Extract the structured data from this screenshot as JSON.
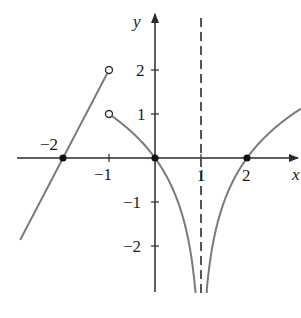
{
  "chart_data": {
    "type": "line",
    "title": "",
    "xlabel": "x",
    "ylabel": "y",
    "xlim": [
      -3.0,
      3.15
    ],
    "ylim": [
      -3.1,
      3.2
    ],
    "grid": false,
    "x_ticks": [
      {
        "value": -1,
        "label": "−1"
      },
      {
        "value": 1,
        "label": "1"
      },
      {
        "value": 2,
        "label": "2"
      }
    ],
    "y_ticks": [
      {
        "value": 2,
        "label": "2"
      },
      {
        "value": 1,
        "label": "1"
      },
      {
        "value": -1,
        "label": "−1"
      },
      {
        "value": -2,
        "label": "−2"
      }
    ],
    "annotations": [
      {
        "text": "−2",
        "at": [
          -2,
          0
        ],
        "note": "x-intercept label"
      }
    ],
    "vertical_asymptote": {
      "x": 1,
      "style": "dashed"
    },
    "series": [
      {
        "name": "left-line",
        "formula": "y = 2x + 4",
        "x_range": [
          -2.93,
          -1
        ],
        "points": [
          [
            -2.93,
            -1.86
          ],
          [
            -2,
            0
          ],
          [
            -1,
            2
          ]
        ],
        "end": {
          "point": [
            -1,
            2
          ],
          "marker": "open"
        }
      },
      {
        "name": "middle-curve",
        "formula": "y = log2(1 - x)",
        "x_range": [
          -1,
          0.97
        ],
        "points": [
          [
            -1,
            1
          ],
          [
            -0.5,
            0.585
          ],
          [
            0,
            0
          ],
          [
            0.5,
            -1
          ],
          [
            0.75,
            -2
          ],
          [
            0.9,
            -3.32
          ]
        ],
        "start": {
          "point": [
            -1,
            1
          ],
          "marker": "open"
        }
      },
      {
        "name": "right-curve",
        "formula": "y = log2(x - 1)",
        "x_range": [
          1.03,
          3.17
        ],
        "points": [
          [
            1.1,
            -3.32
          ],
          [
            1.25,
            -2
          ],
          [
            1.5,
            -1
          ],
          [
            2,
            0
          ],
          [
            3,
            1
          ],
          [
            3.17,
            1.12
          ]
        ]
      }
    ],
    "key_points": [
      {
        "point": [
          -2,
          0
        ],
        "marker": "filled"
      },
      {
        "point": [
          0,
          0
        ],
        "marker": "filled"
      },
      {
        "point": [
          2,
          0
        ],
        "marker": "filled"
      },
      {
        "point": [
          -1,
          2
        ],
        "marker": "open"
      },
      {
        "point": [
          -1,
          1
        ],
        "marker": "open"
      }
    ]
  },
  "style": {
    "axis_color": "#2a2a2a",
    "curve_color": "#7a7a7a",
    "point_color": "#111111"
  },
  "labels": {
    "x_axis": "x",
    "y_axis": "y",
    "x_tick_neg1": "−1",
    "x_tick_1": "1",
    "x_tick_2": "2",
    "x_intercept_neg2": "−2",
    "y_tick_2": "2",
    "y_tick_1": "1",
    "y_tick_neg1": "−1",
    "y_tick_neg2": "−2"
  }
}
